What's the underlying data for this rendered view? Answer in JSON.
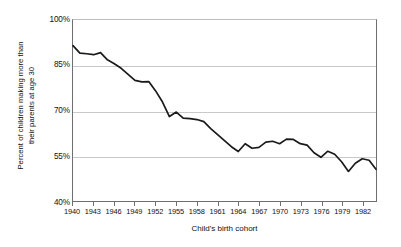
{
  "chart_data": {
    "type": "line",
    "title": "",
    "xlabel": "Child's birth cohort",
    "ylabel": "Percent of children making more than their parents at age 30",
    "ylabel_line1": "Percent of children making more than",
    "ylabel_line2": "their parents at age 30",
    "xlim": [
      1940,
      1984
    ],
    "ylim": [
      40,
      100
    ],
    "grid": "horizontal",
    "legend": "none",
    "line_color": "#1a1a1a",
    "grid_color": "#c9c9c9",
    "axis_color": "#6f6f6f",
    "y_ticks": [
      100,
      85,
      70,
      55,
      40
    ],
    "y_tick_labels": [
      "100%",
      "85%",
      "70%",
      "55%",
      "40%"
    ],
    "x_ticks": [
      1940,
      1943,
      1946,
      1949,
      1952,
      1955,
      1958,
      1961,
      1964,
      1967,
      1970,
      1973,
      1976,
      1979,
      1982
    ],
    "x_tick_labels": [
      "1940",
      "1943",
      "1946",
      "1949",
      "1952",
      "1955",
      "1958",
      "1961",
      "1964",
      "1967",
      "1970",
      "1973",
      "1976",
      "1979",
      "1982"
    ],
    "x": [
      1940,
      1941,
      1942,
      1943,
      1944,
      1945,
      1946,
      1947,
      1948,
      1949,
      1950,
      1951,
      1952,
      1953,
      1954,
      1955,
      1956,
      1957,
      1958,
      1959,
      1960,
      1961,
      1962,
      1963,
      1964,
      1965,
      1966,
      1967,
      1968,
      1969,
      1970,
      1971,
      1972,
      1973,
      1974,
      1975,
      1976,
      1977,
      1978,
      1979,
      1980,
      1981,
      1982,
      1983,
      1984
    ],
    "values": [
      91.5,
      89.0,
      88.8,
      88.5,
      89.2,
      86.8,
      85.5,
      84.0,
      82.0,
      80.0,
      79.5,
      79.6,
      76.5,
      72.8,
      68.0,
      69.5,
      67.5,
      67.3,
      67.0,
      66.3,
      64.0,
      62.0,
      60.0,
      58.0,
      56.4,
      59.0,
      57.5,
      57.8,
      59.5,
      59.8,
      59.0,
      60.5,
      60.4,
      59.0,
      58.5,
      56.0,
      54.5,
      56.5,
      55.5,
      53.0,
      49.8,
      52.5,
      54.0,
      53.5,
      50.5
    ],
    "series": [
      {
        "name": "Percent of children earning more than their parents",
        "values": [
          91.5,
          89.0,
          88.8,
          88.5,
          89.2,
          86.8,
          85.5,
          84.0,
          82.0,
          80.0,
          79.5,
          79.6,
          76.5,
          72.8,
          68.0,
          69.5,
          67.5,
          67.3,
          67.0,
          66.3,
          64.0,
          62.0,
          60.0,
          58.0,
          56.4,
          59.0,
          57.5,
          57.8,
          59.5,
          59.8,
          59.0,
          60.5,
          60.4,
          59.0,
          58.5,
          56.0,
          54.5,
          56.5,
          55.5,
          53.0,
          49.8,
          52.5,
          54.0,
          53.5,
          50.5
        ]
      }
    ]
  }
}
